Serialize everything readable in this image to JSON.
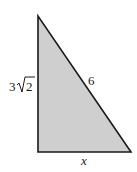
{
  "diagram": {
    "type": "right-triangle",
    "colors": {
      "fill": "#cfcfcf",
      "stroke": "#1a1a1a",
      "background": "#ffffff"
    },
    "vertices": {
      "top": [
        38,
        16
      ],
      "bottom_left": [
        38,
        152
      ],
      "bottom_right": [
        131,
        152
      ]
    },
    "labels": {
      "vertical_leg": "3√2",
      "vertical_leg_coef": "3",
      "vertical_leg_radicand": "2",
      "hypotenuse": "6",
      "horizontal_leg": "x"
    }
  }
}
